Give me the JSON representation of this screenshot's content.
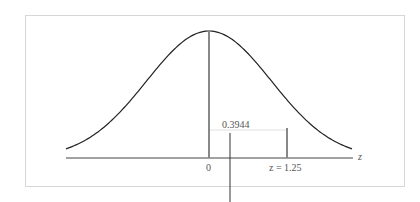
{
  "chart_data": {
    "type": "area",
    "title": "",
    "xlabel": "z",
    "ylabel": "",
    "distribution": "standard normal",
    "x_ticks": [
      {
        "value": 0,
        "label": "0"
      },
      {
        "value": 1.25,
        "label": "z = 1.25"
      }
    ],
    "shaded_region": {
      "from": 0,
      "to": 1.25,
      "area": 0.3944,
      "label": "0.3944"
    },
    "xlim": [
      -3.2,
      3.2
    ],
    "grid": false,
    "legend": null
  },
  "labels": {
    "axis": "z",
    "zero": "0",
    "zval": "z = 1.25",
    "area": "0.3944"
  }
}
